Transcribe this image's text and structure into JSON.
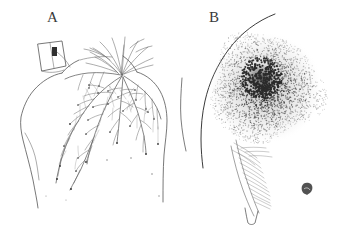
{
  "figure": {
    "background_color": "#ffffff",
    "ink_color": "#4a4a4a",
    "stipple_color": "#2b2b2b",
    "width": 359,
    "height": 234,
    "panels": [
      {
        "id": "A",
        "label": "A",
        "subject": "human-upper-back-line-drawing",
        "features": [
          "torso-outline",
          "neck-and-hair-strands",
          "left-shoulder-rectangular-mark",
          "branching-fern-pattern"
        ],
        "branch_origin": {
          "x": 122,
          "y": 75
        },
        "branch_count": 7,
        "description": "Posterior view of upper back with arborescent branching (fern-like) marks radiating downward and laterally from a point near the right side of the nape."
      },
      {
        "id": "B",
        "label": "B",
        "subject": "stippled-circular-lesion",
        "features": [
          "body-contour-line",
          "stippled-round-lesion",
          "dark-central-core",
          "hatched-shading-fold",
          "satellite-mark"
        ],
        "lesion_center": {
          "x": 86,
          "y": 88
        },
        "lesion_radius": 56,
        "core_radius": 13,
        "stipple_dot_count": 2200,
        "satellite_mark": {
          "x": 128,
          "y": 191
        },
        "description": "Close-up of a round, densely stippled erythematous lesion with a dark central core, bounded on the left by a curving skin contour, with hatched shading below and a small satellite mark to the lower right."
      }
    ]
  }
}
